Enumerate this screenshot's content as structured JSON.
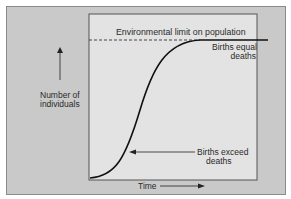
{
  "diagram": {
    "type": "logistic population growth curve",
    "limit_label": "Environmental limit on population",
    "y_axis_label_line1": "Number of",
    "y_axis_label_line2": "individuals",
    "x_axis_label": "Time",
    "plateau_label_line1": "Births equal",
    "plateau_label_line2": "deaths",
    "growth_label_line1": "Births exceed",
    "growth_label_line2": "deaths"
  }
}
